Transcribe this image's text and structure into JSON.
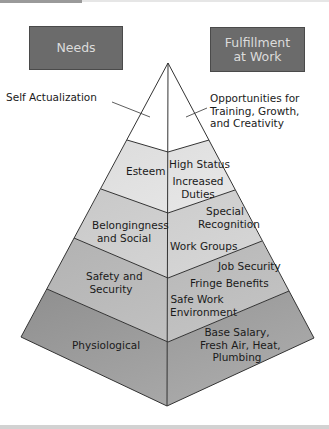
{
  "headers": {
    "needs": "Needs",
    "fulfillment_line1": "Fulfillment",
    "fulfillment_line2": "at Work"
  },
  "colors": {
    "header_box": "#6b6b6b",
    "header_text": "#dcdcdc",
    "tier_self_actualization": "#ffffff",
    "tier_esteem": "#e3e3e3",
    "tier_belongingness": "#d0d0d0",
    "tier_safety": "#bdbdbd",
    "tier_physiological": "#a2a2a2",
    "lines": "#333333"
  },
  "tiers": [
    {
      "need": "Self Actualization",
      "fulfillment": [
        "Opportunities for",
        "Training, Growth,",
        "and Creativity"
      ]
    },
    {
      "need": "Esteem",
      "fulfillment": [
        "High Status",
        "Increased",
        "Duties"
      ]
    },
    {
      "need_line1": "Belongingness",
      "need_line2": "and Social",
      "fulfillment": [
        "Special",
        "Recognition",
        "Work Groups"
      ]
    },
    {
      "need_line1": "Safety and",
      "need_line2": "Security",
      "fulfillment": [
        "Job Security",
        "Fringe Benefits",
        "Safe Work",
        "Environment"
      ]
    },
    {
      "need": "Physiological",
      "fulfillment": [
        "Base Salary,",
        "Fresh Air, Heat,",
        "Plumbing"
      ]
    }
  ]
}
